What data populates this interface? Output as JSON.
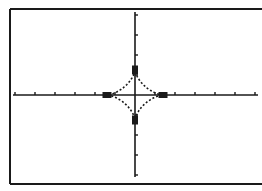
{
  "chart_data": {
    "type": "line",
    "title": "",
    "xlabel": "",
    "ylabel": "",
    "xlim": [
      -6,
      6
    ],
    "ylim": [
      -4,
      4
    ],
    "grid": false,
    "axes": {
      "x_tick_step": 1,
      "y_tick_step": 1
    },
    "curve": {
      "name": "astroid",
      "equation": "x^(2/3) + y^(2/3) = a^(2/3)",
      "a_x": 1.4,
      "a_y": 1.25,
      "style": "dotted"
    },
    "markers": [
      {
        "x": -1.4,
        "y": 0
      },
      {
        "x": 1.4,
        "y": 0
      },
      {
        "x": 0,
        "y": 1.25
      },
      {
        "x": 0,
        "y": -1.25
      }
    ]
  },
  "plot": {
    "frame": {
      "left": 10,
      "top": 9,
      "right": 262,
      "bottom": 184
    },
    "origin": {
      "x": 135,
      "y": 95
    },
    "px_per_unit": 20,
    "x_axis": {
      "from": 13,
      "to": 258
    },
    "y_axis": {
      "from": 12,
      "to": 177
    },
    "colors": {
      "ink": "#1a1a1a",
      "background": "#ffffff"
    }
  }
}
